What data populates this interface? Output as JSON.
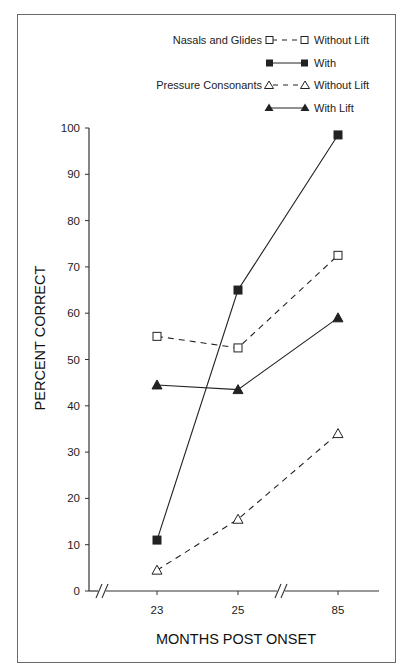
{
  "chart_data": {
    "type": "line",
    "title": "",
    "xlabel": "MONTHS POST ONSET",
    "ylabel": "PERCENT CORRECT",
    "categories": [
      "23",
      "25",
      "85"
    ],
    "ylim": [
      0,
      100
    ],
    "yticks": [
      0,
      10,
      20,
      30,
      40,
      50,
      60,
      70,
      80,
      90,
      100
    ],
    "grid": false,
    "legend_position": "top-right",
    "axis_breaks": [
      "x-axis near origin",
      "x-axis between 25 and 85"
    ],
    "series": [
      {
        "group": "Nasals and Glides",
        "name": "Without Lift",
        "marker": "open-square",
        "line": "dashed",
        "values": [
          55,
          52.5,
          72.5
        ]
      },
      {
        "group": "Nasals and Glides",
        "name": "With",
        "marker": "filled-square",
        "line": "solid",
        "values": [
          11,
          65,
          98.5
        ]
      },
      {
        "group": "Pressure Consonants",
        "name": "Without Lift",
        "marker": "open-triangle",
        "line": "dashed",
        "values": [
          4.5,
          15.5,
          34
        ]
      },
      {
        "group": "Pressure Consonants",
        "name": "With Lift",
        "marker": "filled-triangle",
        "line": "solid",
        "values": [
          44.5,
          43.5,
          59
        ]
      }
    ]
  },
  "legend": {
    "group1": "Nasals and Glides",
    "group2": "Pressure Consonants",
    "items": [
      {
        "label": "Without Lift"
      },
      {
        "label": "With"
      },
      {
        "label": "Without Lift"
      },
      {
        "label": "With Lift"
      }
    ]
  },
  "axes": {
    "x_ticks": [
      "23",
      "25",
      "85"
    ],
    "y_ticks": [
      "0",
      "10",
      "20",
      "30",
      "40",
      "50",
      "60",
      "70",
      "80",
      "90",
      "100"
    ],
    "x_title": "MONTHS POST ONSET",
    "y_title": "PERCENT CORRECT"
  },
  "colors": {
    "ink": "#1a1a1a",
    "frame": "#6a6a6a"
  }
}
